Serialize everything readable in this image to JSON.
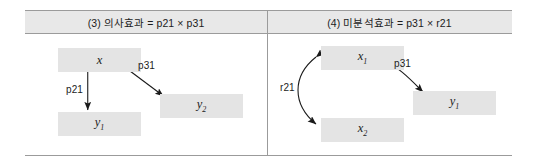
{
  "figure": {
    "panels": [
      {
        "header": "(3) 의사효과 = p21 × p31",
        "nodes": [
          {
            "id": "x",
            "base": "x",
            "sub": ""
          },
          {
            "id": "y1",
            "base": "y",
            "sub": "1"
          },
          {
            "id": "y2",
            "base": "y",
            "sub": "2"
          }
        ],
        "edges": [
          {
            "from": "x",
            "to": "y1",
            "label": "p21",
            "kind": "straight-down"
          },
          {
            "from": "x",
            "to": "y2",
            "label": "p31",
            "kind": "diagonal"
          }
        ]
      },
      {
        "header": "(4) 미분석효과 = p31 × r21",
        "nodes": [
          {
            "id": "x1",
            "base": "x",
            "sub": "1"
          },
          {
            "id": "x2",
            "base": "x",
            "sub": "2"
          },
          {
            "id": "y1",
            "base": "y",
            "sub": "1"
          }
        ],
        "edges": [
          {
            "from": "x1",
            "to": "x2",
            "label": "r21",
            "kind": "curved-double"
          },
          {
            "from": "x1",
            "to": "y1",
            "label": "p31",
            "kind": "curved-arrow"
          }
        ]
      }
    ],
    "colors": {
      "node_fill": "#e4e4e4",
      "header_fill": "#e8e8e8",
      "border": "#9b9b9b",
      "arrow": "#1a1a1a",
      "text": "#1c1c1c"
    }
  }
}
